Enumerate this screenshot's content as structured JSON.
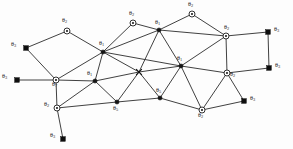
{
  "figure": {
    "title": "",
    "faint_header_text": "",
    "width": 293,
    "height": 149,
    "background_color": "#fdfdfd",
    "edge_color": "#2b2b2b",
    "node_fill_dark": "#151515",
    "node_fill_light": "#ffffff"
  },
  "legend_symbols": {
    "dot": "filled-circle-node",
    "circle": "open-circle-node",
    "square": "filled-square-node",
    "cross": "cross-junction-node"
  },
  "chart_data": {
    "type": "scatter",
    "title": "",
    "xlabel": "",
    "ylabel": "",
    "xlim": [
      0,
      293
    ],
    "ylim": [
      0,
      149
    ],
    "grid": false,
    "legend": "none",
    "nodes": [
      {
        "id": "n1",
        "shape": "circle",
        "x": 67,
        "y": 31,
        "label": "θ",
        "sub": "2",
        "label_dx": -5,
        "label_dy": -11
      },
      {
        "id": "n2",
        "shape": "square",
        "x": 26,
        "y": 48,
        "label": "θ",
        "sub": "3",
        "label_dx": -15,
        "label_dy": -4
      },
      {
        "id": "n3",
        "shape": "square",
        "x": 17,
        "y": 80,
        "label": "θ",
        "sub": "3",
        "label_dx": -15,
        "label_dy": -4
      },
      {
        "id": "n4",
        "shape": "circle",
        "x": 56,
        "y": 80,
        "label": "θ",
        "sub": "7",
        "label_dx": -4,
        "label_dy": 4
      },
      {
        "id": "n5",
        "shape": "circle",
        "x": 57,
        "y": 108,
        "label": "θ",
        "sub": "2",
        "label_dx": -13,
        "label_dy": -4
      },
      {
        "id": "n6",
        "shape": "square",
        "x": 63,
        "y": 139,
        "label": "θ",
        "sub": "3",
        "label_dx": -13,
        "label_dy": -4
      },
      {
        "id": "n7",
        "shape": "dot",
        "x": 103,
        "y": 52,
        "label": "θ",
        "sub": "1",
        "label_dx": -4,
        "label_dy": -9
      },
      {
        "id": "n8",
        "shape": "circle",
        "x": 133,
        "y": 23,
        "label": "θ",
        "sub": "2",
        "label_dx": -4,
        "label_dy": -10
      },
      {
        "id": "n9",
        "shape": "dot",
        "x": 159,
        "y": 30,
        "label": "θ",
        "sub": "1",
        "label_dx": -4,
        "label_dy": -8
      },
      {
        "id": "n10",
        "shape": "circle",
        "x": 192,
        "y": 14,
        "label": "θ",
        "sub": "2",
        "label_dx": -4,
        "label_dy": -10
      },
      {
        "id": "n11",
        "shape": "circle",
        "x": 226,
        "y": 36,
        "label": "θ",
        "sub": "2",
        "label_dx": -2,
        "label_dy": -9
      },
      {
        "id": "n12",
        "shape": "square",
        "x": 268,
        "y": 32,
        "label": "θ",
        "sub": "3",
        "label_dx": 6,
        "label_dy": -3
      },
      {
        "id": "n13",
        "shape": "square",
        "x": 269,
        "y": 68,
        "label": "θ",
        "sub": "3",
        "label_dx": 6,
        "label_dy": -3
      },
      {
        "id": "n14",
        "shape": "circle",
        "x": 227,
        "y": 73,
        "label": "θ",
        "sub": "2",
        "label_dx": 3,
        "label_dy": 1
      },
      {
        "id": "n15",
        "shape": "dot",
        "x": 181,
        "y": 66,
        "label": "θ",
        "sub": "1",
        "label_dx": -4,
        "label_dy": -8
      },
      {
        "id": "n16",
        "shape": "cross",
        "x": 139,
        "y": 72,
        "label": "",
        "sub": "",
        "label_dx": 0,
        "label_dy": 0
      },
      {
        "id": "n17",
        "shape": "dot",
        "x": 95,
        "y": 81,
        "label": "θ",
        "sub": "1",
        "label_dx": -8,
        "label_dy": -8
      },
      {
        "id": "n18",
        "shape": "dot",
        "x": 117,
        "y": 102,
        "label": "θ",
        "sub": "5",
        "label_dx": -4,
        "label_dy": 6
      },
      {
        "id": "n19",
        "shape": "dot",
        "x": 160,
        "y": 98,
        "label": "θ",
        "sub": "5",
        "label_dx": -4,
        "label_dy": -8
      },
      {
        "id": "n20",
        "shape": "circle",
        "x": 202,
        "y": 110,
        "label": "θ",
        "sub": "2",
        "label_dx": -4,
        "label_dy": 5
      },
      {
        "id": "n21",
        "shape": "square",
        "x": 244,
        "y": 101,
        "label": "θ",
        "sub": "3",
        "label_dx": 6,
        "label_dy": -3
      }
    ],
    "edges": [
      [
        "n1",
        "n2"
      ],
      [
        "n1",
        "n7"
      ],
      [
        "n2",
        "n4"
      ],
      [
        "n3",
        "n4"
      ],
      [
        "n4",
        "n5"
      ],
      [
        "n4",
        "n7"
      ],
      [
        "n4",
        "n17"
      ],
      [
        "n5",
        "n6"
      ],
      [
        "n5",
        "n17"
      ],
      [
        "n5",
        "n18"
      ],
      [
        "n7",
        "n8"
      ],
      [
        "n7",
        "n9"
      ],
      [
        "n7",
        "n15"
      ],
      [
        "n7",
        "n16"
      ],
      [
        "n7",
        "n17"
      ],
      [
        "n8",
        "n9"
      ],
      [
        "n9",
        "n10"
      ],
      [
        "n9",
        "n15"
      ],
      [
        "n9",
        "n16"
      ],
      [
        "n9",
        "n11"
      ],
      [
        "n10",
        "n11"
      ],
      [
        "n11",
        "n12"
      ],
      [
        "n11",
        "n14"
      ],
      [
        "n11",
        "n15"
      ],
      [
        "n12",
        "n13"
      ],
      [
        "n13",
        "n14"
      ],
      [
        "n14",
        "n15"
      ],
      [
        "n14",
        "n20"
      ],
      [
        "n14",
        "n21"
      ],
      [
        "n15",
        "n16"
      ],
      [
        "n15",
        "n19"
      ],
      [
        "n15",
        "n20"
      ],
      [
        "n16",
        "n17"
      ],
      [
        "n16",
        "n18"
      ],
      [
        "n16",
        "n19"
      ],
      [
        "n17",
        "n18"
      ],
      [
        "n18",
        "n19"
      ],
      [
        "n19",
        "n20"
      ],
      [
        "n20",
        "n21"
      ]
    ]
  }
}
